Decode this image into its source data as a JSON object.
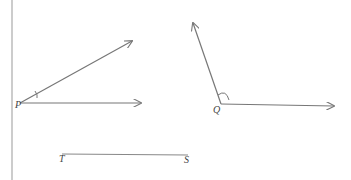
{
  "diagram": {
    "left_rule": {
      "x": 12,
      "y1": 0,
      "y2": 180
    },
    "angle_p": {
      "label": "P",
      "vertex": [
        20,
        103
      ],
      "ray1_end": [
        132,
        41
      ],
      "ray2_end": [
        141,
        103
      ],
      "marker": "single tick arc"
    },
    "angle_q": {
      "label": "Q",
      "vertex": [
        221,
        104
      ],
      "ray1_end": [
        193,
        23
      ],
      "ray2_end": [
        334,
        106
      ],
      "marker": "arc"
    },
    "segment_ts": {
      "start_label": "T",
      "end_label": "S",
      "start": [
        62,
        154
      ],
      "end": [
        188,
        155
      ]
    },
    "colors": {
      "stroke": "#777777",
      "label": "#444444",
      "background": "#ffffff"
    }
  }
}
